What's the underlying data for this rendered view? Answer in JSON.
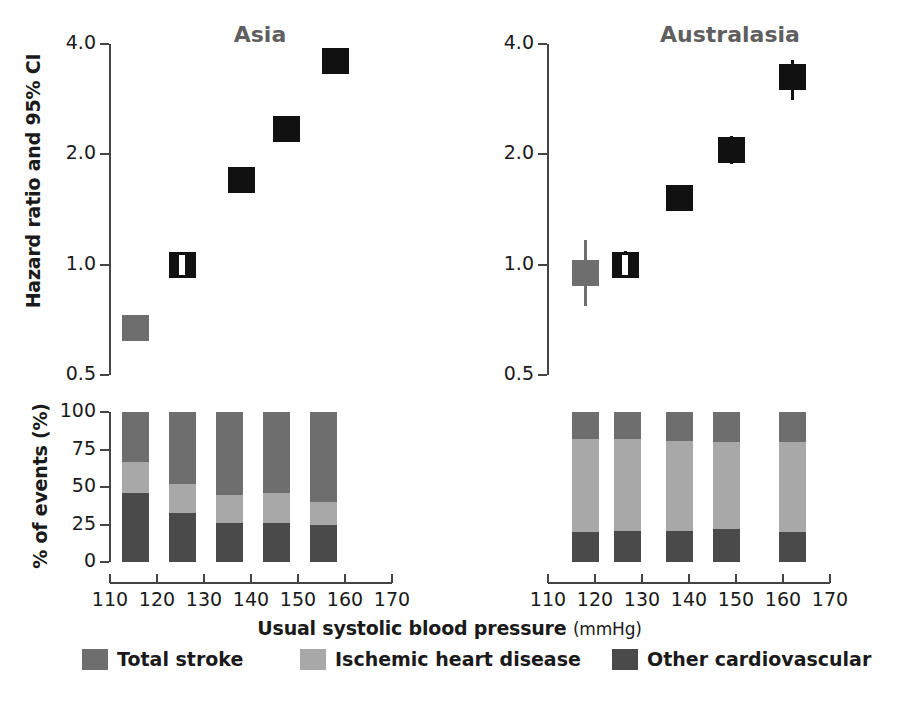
{
  "figure": {
    "ylabel_hazard": "Hazard ratio and 95% CI",
    "ylabel_percent": "% of events (%)",
    "xlabel_main": "Usual systolic blood pressure",
    "xlabel_unit": "(mmHg)"
  },
  "colors": {
    "total_stroke": "#6e6e6e",
    "ischemic_heart_disease": "#a8a8a8",
    "other_cardiovascular": "#4a4a4a",
    "marker_dark": "#111111",
    "marker_gray": "#6e6e6e",
    "axis": "#444444",
    "title": "#5f5f5f",
    "text": "#1a1a1a"
  },
  "legend": {
    "items": [
      {
        "label": "Total stroke",
        "color": "#6e6e6e"
      },
      {
        "label": "Ischemic heart disease",
        "color": "#a8a8a8"
      },
      {
        "label": "Other cardiovascular",
        "color": "#4a4a4a"
      }
    ]
  },
  "axes": {
    "hazard_yticks": [
      "4.0",
      "2.0",
      "1.0",
      "0.5"
    ],
    "hazard_ytick_values": [
      4.0,
      2.0,
      1.0,
      0.5
    ],
    "percent_yticks": [
      "100",
      "75",
      "50",
      "25",
      "0"
    ],
    "percent_ytick_values": [
      100,
      75,
      50,
      25,
      0
    ],
    "xticks": [
      "110",
      "120",
      "130",
      "140",
      "150",
      "160",
      "170"
    ],
    "xtick_values": [
      110,
      120,
      130,
      140,
      150,
      160,
      170
    ]
  },
  "panels": [
    {
      "key": "asia",
      "title": "Asia"
    },
    {
      "key": "australasia",
      "title": "Australasia"
    }
  ],
  "chart_data": [
    {
      "type": "scatter",
      "title": "Asia",
      "subtitle": "Hazard ratio by usual systolic blood pressure",
      "xlabel": "Usual systolic blood pressure (mmHg)",
      "ylabel": "Hazard ratio and 95% CI",
      "yscale": "log",
      "ylim": [
        0.5,
        4.0
      ],
      "xlim": [
        110,
        170
      ],
      "grid": false,
      "legend": "none",
      "yticks": [
        0.5,
        1.0,
        2.0,
        4.0
      ],
      "xticks": [
        110,
        120,
        130,
        140,
        150,
        160,
        170
      ],
      "x": [
        115.5,
        125.5,
        138.0,
        147.5,
        158.0
      ],
      "values": [
        0.67,
        1.0,
        1.7,
        2.35,
        3.6
      ],
      "ci_low": [
        0.63,
        0.96,
        1.58,
        2.22,
        3.42
      ],
      "ci_high": [
        0.71,
        1.04,
        1.82,
        2.49,
        3.82
      ],
      "reference_index": 1,
      "point_colors": [
        "#6e6e6e",
        "#111111",
        "#111111",
        "#111111",
        "#111111"
      ]
    },
    {
      "type": "scatter",
      "title": "Australasia",
      "subtitle": "Hazard ratio by usual systolic blood pressure",
      "xlabel": "Usual systolic blood pressure (mmHg)",
      "ylabel": "Hazard ratio and 95% CI",
      "yscale": "log",
      "ylim": [
        0.5,
        4.0
      ],
      "xlim": [
        110,
        170
      ],
      "grid": false,
      "legend": "none",
      "yticks": [
        0.5,
        1.0,
        2.0,
        4.0
      ],
      "xticks": [
        110,
        120,
        130,
        140,
        150,
        160,
        170
      ],
      "x": [
        118.0,
        126.5,
        138.0,
        149.0,
        162.0
      ],
      "values": [
        0.95,
        1.0,
        1.52,
        2.05,
        3.25
      ],
      "ci_low": [
        0.77,
        0.92,
        1.4,
        1.88,
        2.82
      ],
      "ci_high": [
        1.17,
        1.09,
        1.65,
        2.24,
        3.62
      ],
      "reference_index": 1,
      "point_colors": [
        "#6e6e6e",
        "#111111",
        "#111111",
        "#111111",
        "#111111"
      ]
    },
    {
      "type": "bar",
      "stacked": true,
      "title": "Asia",
      "subtitle": "Distribution of cardiovascular events",
      "xlabel": "Usual systolic blood pressure (mmHg)",
      "ylabel": "% of events (%)",
      "ylim": [
        0,
        100
      ],
      "xlim": [
        110,
        170
      ],
      "grid": false,
      "legend": "bottom",
      "yticks": [
        0,
        25,
        50,
        75,
        100
      ],
      "xticks": [
        110,
        120,
        130,
        140,
        150,
        160,
        170
      ],
      "categories": [
        "115",
        "125",
        "135",
        "145",
        "155"
      ],
      "x": [
        115.5,
        125.5,
        135.5,
        145.5,
        155.5
      ],
      "series": [
        {
          "name": "Other cardiovascular",
          "color": "#4a4a4a",
          "values": [
            46,
            33,
            26,
            26,
            25
          ]
        },
        {
          "name": "Ischemic heart disease",
          "color": "#a8a8a8",
          "values": [
            21,
            19,
            19,
            20,
            15
          ]
        },
        {
          "name": "Total stroke",
          "color": "#6e6e6e",
          "values": [
            33,
            48,
            55,
            54,
            60
          ]
        }
      ]
    },
    {
      "type": "bar",
      "stacked": true,
      "title": "Australasia",
      "subtitle": "Distribution of cardiovascular events",
      "xlabel": "Usual systolic blood pressure (mmHg)",
      "ylabel": "% of events (%)",
      "ylim": [
        0,
        100
      ],
      "xlim": [
        110,
        170
      ],
      "grid": false,
      "legend": "bottom",
      "yticks": [
        0,
        25,
        50,
        75,
        100
      ],
      "xticks": [
        110,
        120,
        130,
        140,
        150,
        160,
        170
      ],
      "categories": [
        "118",
        "127",
        "138",
        "148",
        "162"
      ],
      "x": [
        118.0,
        127.0,
        138.0,
        148.0,
        162.0
      ],
      "series": [
        {
          "name": "Other cardiovascular",
          "color": "#4a4a4a",
          "values": [
            20,
            21,
            21,
            22,
            20
          ]
        },
        {
          "name": "Ischemic heart disease",
          "color": "#a8a8a8",
          "values": [
            62,
            61,
            60,
            58,
            60
          ]
        },
        {
          "name": "Total stroke",
          "color": "#6e6e6e",
          "values": [
            18,
            18,
            19,
            20,
            20
          ]
        }
      ]
    }
  ]
}
